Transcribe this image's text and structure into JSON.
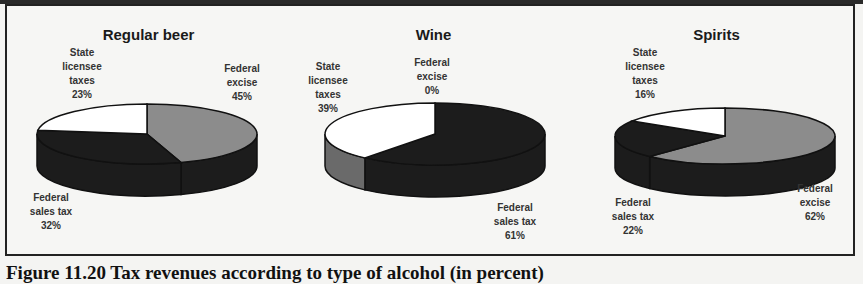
{
  "caption": "Figure 11.20 Tax revenues according to type of alcohol (in percent)",
  "colors": {
    "federal_excise": "#8c8c8c",
    "federal_sales_tax": "#1c1c1c",
    "state_licensee_taxes": "#ffffff",
    "background": "#f6f6f4",
    "frame": "#222222"
  },
  "charts": [
    {
      "title": "Regular beer",
      "labels": {
        "state": [
          "State",
          "licensee",
          "taxes",
          "23%"
        ],
        "excise": [
          "Federal",
          "excise",
          "45%"
        ],
        "sales": [
          "Federal",
          "sales tax",
          "32%"
        ]
      }
    },
    {
      "title": "Wine",
      "labels": {
        "state": [
          "State",
          "licensee",
          "taxes",
          "39%"
        ],
        "excise": [
          "Federal",
          "excise",
          "0%"
        ],
        "sales": [
          "Federal",
          "sales tax",
          "61%"
        ]
      }
    },
    {
      "title": "Spirits",
      "labels": {
        "state": [
          "State",
          "licensee",
          "taxes",
          "16%"
        ],
        "excise": [
          "Federal",
          "excise",
          "62%"
        ],
        "sales": [
          "Federal",
          "sales tax",
          "22%"
        ]
      }
    }
  ],
  "chart_data": [
    {
      "type": "pie",
      "title": "Regular beer",
      "categories": [
        "Federal excise",
        "Federal sales tax",
        "State licensee taxes"
      ],
      "values": [
        45,
        32,
        23
      ],
      "unit": "%",
      "style": "3d"
    },
    {
      "type": "pie",
      "title": "Wine",
      "categories": [
        "Federal excise",
        "Federal sales tax",
        "State licensee taxes"
      ],
      "values": [
        0,
        61,
        39
      ],
      "unit": "%",
      "style": "3d"
    },
    {
      "type": "pie",
      "title": "Spirits",
      "categories": [
        "Federal excise",
        "Federal sales tax",
        "State licensee taxes"
      ],
      "values": [
        62,
        22,
        16
      ],
      "unit": "%",
      "style": "3d"
    }
  ]
}
